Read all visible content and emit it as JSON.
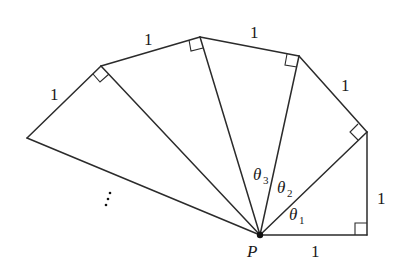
{
  "diagram": {
    "type": "spiral-of-theodorus",
    "center_point": {
      "label": "P"
    },
    "side_labels": [
      "1",
      "1",
      "1",
      "1",
      "1",
      "1"
    ],
    "angle_labels": [
      {
        "symbol": "θ",
        "subscript": "1"
      },
      {
        "symbol": "θ",
        "subscript": "2"
      },
      {
        "symbol": "θ",
        "subscript": "3"
      }
    ],
    "continuation_mark": "⋮",
    "colors": {
      "stroke": "#2b2b2b",
      "text": "#1a1a1a",
      "background": "#ffffff"
    }
  }
}
